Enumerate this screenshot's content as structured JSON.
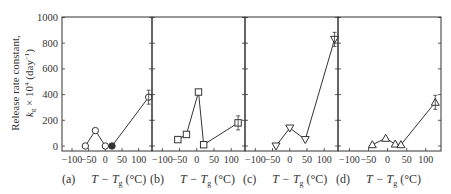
{
  "chart_data": {
    "type": "line",
    "title": "",
    "ylabel_line1": "Release rate constant,",
    "ylabel_line2": "k_g × 10^4 (day^-1)",
    "xlabel": "T − T_g (°C)",
    "ylim": [
      0,
      1000
    ],
    "yticks": [
      0,
      200,
      400,
      600,
      800,
      1000
    ],
    "xlim": [
      -130,
      140
    ],
    "xticks": [
      -100,
      -50,
      0,
      50,
      100
    ],
    "grid": false,
    "legend": "none",
    "panels": [
      {
        "label": "(a)",
        "marker": "circle",
        "x": [
          -60,
          -30,
          0,
          20,
          130
        ],
        "y": [
          0,
          120,
          0,
          0,
          380
        ],
        "filled": [
          false,
          false,
          false,
          true,
          false
        ]
      },
      {
        "label": "(b)",
        "marker": "square",
        "x": [
          -55,
          -30,
          5,
          20,
          120
        ],
        "y": [
          50,
          90,
          420,
          10,
          180
        ],
        "filled": [
          false,
          false,
          false,
          false,
          false
        ]
      },
      {
        "label": "(c)",
        "marker": "triangle-down",
        "x": [
          -40,
          0,
          45,
          130
        ],
        "y": [
          0,
          140,
          50,
          830
        ],
        "filled": [
          false,
          false,
          false,
          false
        ]
      },
      {
        "label": "(d)",
        "marker": "triangle-up",
        "x": [
          -40,
          -5,
          20,
          35,
          125
        ],
        "y": [
          10,
          60,
          15,
          10,
          340
        ],
        "filled": [
          false,
          false,
          false,
          false,
          false
        ]
      }
    ]
  },
  "captions": {
    "a": {
      "tag": "(a)",
      "var": "T − T",
      "sub": "g",
      "unit": " (°C)"
    },
    "b": {
      "tag": "(b)",
      "var": "T − T",
      "sub": "g",
      "unit": " (°C)"
    },
    "c": {
      "tag": "(c)",
      "var": "T − T",
      "sub": "g",
      "unit": " (°C)"
    },
    "d": {
      "tag": "(d)",
      "var": "T − T",
      "sub": "g",
      "unit": " (°C)"
    }
  },
  "ylabel": {
    "line1": "Release rate constant,",
    "line2_k": "k",
    "line2_sub": "g",
    "line2_rest": " × 10",
    "line2_exp": "4",
    "line2_unit": " (day",
    "line2_unit_exp": "−1",
    "line2_close": ")"
  }
}
